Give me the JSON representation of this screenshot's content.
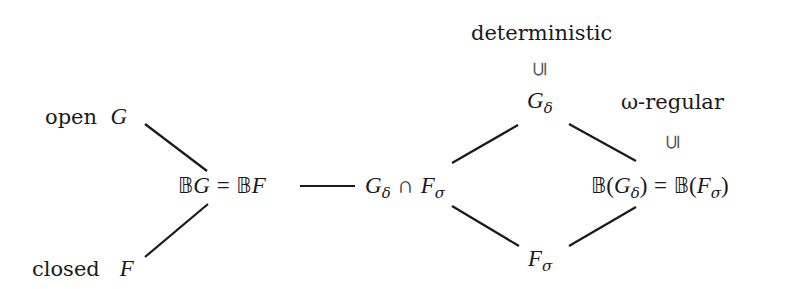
{
  "diagram": {
    "type": "hasse-diagram",
    "nodes": {
      "open": {
        "label": "open",
        "symbol": "G"
      },
      "closed": {
        "label": "closed",
        "symbol": "F"
      },
      "boolean_open": {
        "left_bb": "𝔹",
        "left_sym": "G",
        "eq": "=",
        "right_bb": "𝔹",
        "right_sym": "F"
      },
      "gdelta_cap_fsigma": {
        "a": "G",
        "a_sub": "δ",
        "op": "∩",
        "b": "F",
        "b_sub": "σ"
      },
      "gdelta": {
        "sym": "G",
        "sub": "δ"
      },
      "fsigma": {
        "sym": "F",
        "sub": "σ"
      },
      "boolean_gdelta": {
        "bb1": "𝔹",
        "open1": "(",
        "sym1": "G",
        "sub1": "δ",
        "close1": ")",
        "eq": "=",
        "bb2": "𝔹",
        "open2": "(",
        "sym2": "F",
        "sub2": "σ",
        "close2": ")"
      }
    },
    "annotations": {
      "deterministic": {
        "label": "deterministic",
        "relation": "⊆"
      },
      "omega_regular": {
        "label": "ω-regular",
        "relation": "⊆"
      }
    },
    "edges": [
      {
        "from": "open",
        "to": "boolean_open"
      },
      {
        "from": "closed",
        "to": "boolean_open"
      },
      {
        "from": "boolean_open",
        "to": "gdelta_cap_fsigma"
      },
      {
        "from": "gdelta_cap_fsigma",
        "to": "gdelta"
      },
      {
        "from": "gdelta_cap_fsigma",
        "to": "fsigma"
      },
      {
        "from": "gdelta",
        "to": "boolean_gdelta"
      },
      {
        "from": "fsigma",
        "to": "boolean_gdelta"
      }
    ]
  }
}
